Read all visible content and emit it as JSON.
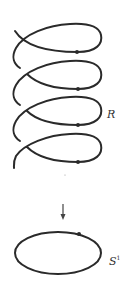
{
  "figure": {
    "helix_label": "R",
    "circle_label": "S",
    "circle_label_superscript": "1",
    "arrow": "down-arrow",
    "colors": {
      "stroke": "#2a2a2a",
      "background": "#ffffff"
    },
    "helix": {
      "loops": 4,
      "marked_points": 4
    },
    "circle": {
      "marked_points": 1
    }
  }
}
